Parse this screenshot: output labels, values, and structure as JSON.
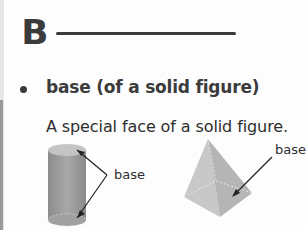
{
  "section": {
    "letter": "B"
  },
  "entry": {
    "term": "base (of a solid figure)",
    "definition": "A special face of a solid figure."
  },
  "figures": {
    "cylinder": {
      "label": "base"
    },
    "pyramid": {
      "label": "base"
    }
  }
}
